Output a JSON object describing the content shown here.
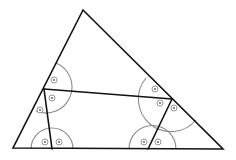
{
  "diagram": {
    "type": "triangle-with-inscribed-quadrilateral",
    "colors": {
      "edge": "#111111",
      "arc": "#8a8a8a",
      "mark": "#7a7a7a",
      "background": "#ffffff"
    },
    "vertices": {
      "top": [
        83,
        10
      ],
      "bottom_left": [
        13,
        148
      ],
      "bottom_right": [
        223,
        149
      ],
      "left_mid": [
        44,
        89
      ],
      "right_mid": [
        172,
        99
      ],
      "bottom_inner_left": [
        52,
        149
      ],
      "bottom_inner_right": [
        148,
        149
      ]
    },
    "angle_marks": [
      {
        "vertex": "left_mid",
        "count": 3,
        "symbol": "circle-dot"
      },
      {
        "vertex": "right_mid",
        "count": 3,
        "symbol": "circle-dot"
      },
      {
        "vertex": "bottom_inner_left",
        "count": 2,
        "symbol": "circle-dot"
      },
      {
        "vertex": "bottom_inner_right",
        "count": 2,
        "symbol": "circle-dot"
      }
    ]
  }
}
